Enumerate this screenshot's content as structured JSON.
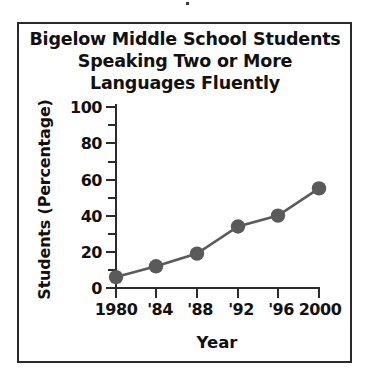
{
  "chart_data": {
    "type": "line",
    "title": "Bigelow Middle School Students Speaking Two or More Languages Fluently",
    "title_lines": [
      "Bigelow Middle School Students",
      "Speaking Two or More",
      "Languages Fluently"
    ],
    "xlabel": "Year",
    "ylabel": "Students (Percentage)",
    "categories": [
      "1980",
      "'84",
      "'88",
      "'92",
      "'96",
      "2000"
    ],
    "x": [
      1980,
      1984,
      1988,
      1992,
      1996,
      2000
    ],
    "values": [
      6,
      12,
      19,
      34,
      40,
      55
    ],
    "ylim": [
      0,
      100
    ],
    "ytick_labels": [
      "0",
      "20",
      "40",
      "60",
      "80",
      "100"
    ],
    "ytick_values": [
      0,
      20,
      40,
      60,
      80,
      100
    ],
    "yminor_values": [
      10,
      30,
      50,
      70,
      90
    ],
    "grid": false,
    "legend": false,
    "marker": "circle",
    "marker_color": "#5a5a5a",
    "line_color": "#5a5a5a",
    "axis_color": "#2b2b2b",
    "frame_color": "#2b2b2b",
    "background": "#ffffff"
  }
}
